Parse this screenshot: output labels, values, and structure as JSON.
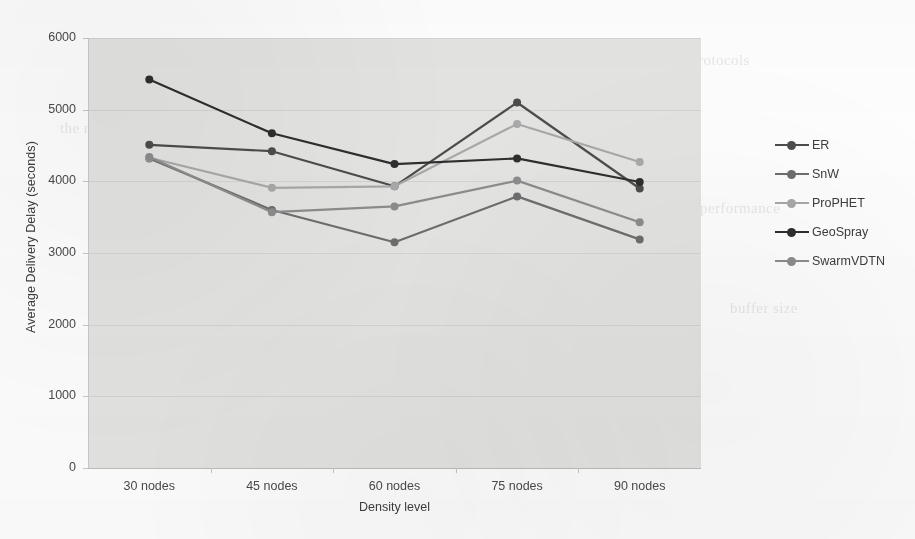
{
  "chart_data": {
    "type": "line",
    "title": "",
    "xlabel": "Density level",
    "ylabel": "Average Delivery Delay (seconds)",
    "categories": [
      "30 nodes",
      "45 nodes",
      "60 nodes",
      "75 nodes",
      "90 nodes"
    ],
    "ylim": [
      0,
      6000
    ],
    "yticks": [
      0,
      1000,
      2000,
      3000,
      4000,
      5000,
      6000
    ],
    "ytick_labels": [
      "0",
      "1000",
      "2000",
      "3000",
      "4000",
      "5000",
      "6000"
    ],
    "grid": true,
    "legend_position": "right",
    "plot_background": "#e3e3e1",
    "series": [
      {
        "name": "ER",
        "color": "#4c4c4c",
        "values": [
          4510,
          4420,
          3930,
          5100,
          3900
        ]
      },
      {
        "name": "SnW",
        "color": "#6d6d6d",
        "values": [
          4320,
          3600,
          3150,
          3790,
          3190
        ]
      },
      {
        "name": "ProPHET",
        "color": "#a8a8a8",
        "values": [
          4330,
          3910,
          3930,
          4800,
          4270
        ]
      },
      {
        "name": "GeoSpray",
        "color": "#2e2e2e",
        "values": [
          5420,
          4670,
          4240,
          4320,
          3990
        ]
      },
      {
        "name": "SwarmVDTN",
        "color": "#8c8c8c",
        "values": [
          4340,
          3570,
          3650,
          4010,
          3430
        ]
      }
    ]
  },
  "legend": {
    "items": [
      {
        "label": "ER"
      },
      {
        "label": "SnW"
      },
      {
        "label": "ProPHET"
      },
      {
        "label": "GeoSpray"
      },
      {
        "label": "SwarmVDTN"
      }
    ]
  },
  "bleed_text": [
    {
      "text": "presented in this section",
      "x": 120,
      "y": 58
    },
    {
      "text": "the results obtained",
      "x": 410,
      "y": 70
    },
    {
      "text": "routing protocols",
      "x": 640,
      "y": 52
    },
    {
      "text": "delivery probability",
      "x": 95,
      "y": 180
    },
    {
      "text": "scenario with the",
      "x": 470,
      "y": 150
    },
    {
      "text": "performance",
      "x": 700,
      "y": 200
    },
    {
      "text": "simulation time",
      "x": 140,
      "y": 300
    },
    {
      "text": "network density",
      "x": 520,
      "y": 330
    },
    {
      "text": "delay in the",
      "x": 200,
      "y": 368
    },
    {
      "text": "nodes are able to deliver the",
      "x": 240,
      "y": 392
    },
    {
      "text": "used as the reference",
      "x": 390,
      "y": 420
    },
    {
      "text": "increases when the number",
      "x": 150,
      "y": 430
    },
    {
      "text": "buffer size",
      "x": 730,
      "y": 300
    },
    {
      "text": "the results",
      "x": 60,
      "y": 120
    }
  ]
}
